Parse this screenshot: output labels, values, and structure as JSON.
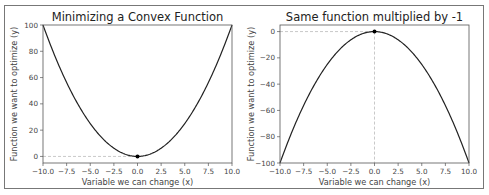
{
  "chart_data": [
    {
      "type": "line",
      "title": "Minimizing a Convex Function",
      "xlabel": "Variable we can change (x)",
      "ylabel": "Function we want to optimize (y)",
      "xlim": [
        -10,
        10
      ],
      "ylim": [
        -5,
        100
      ],
      "xticks": [
        "−10.0",
        "−7.5",
        "−5.0",
        "−2.5",
        "0.0",
        "2.5",
        "5.0",
        "7.5",
        "10.0"
      ],
      "yticks": [
        "0",
        "20",
        "40",
        "60",
        "80",
        "100"
      ],
      "function": "y = x^2",
      "x": [
        -10,
        -7.5,
        -5,
        -2.5,
        0,
        2.5,
        5,
        7.5,
        10
      ],
      "y": [
        100,
        56.25,
        25,
        6.25,
        0,
        6.25,
        25,
        56.25,
        100
      ],
      "annotations": [
        {
          "type": "point",
          "x": 0,
          "y": 0,
          "label": "minimum"
        },
        {
          "type": "dashed-hline",
          "y": 0
        }
      ],
      "grid": false
    },
    {
      "type": "line",
      "title": "Same function multiplied by -1",
      "xlabel": "Variable we can change (x)",
      "ylabel": "Function we want to optimize (y)",
      "xlim": [
        -10,
        10
      ],
      "ylim": [
        -100,
        5
      ],
      "xticks": [
        "−10.0",
        "−7.5",
        "−5.0",
        "−2.5",
        "0.0",
        "2.5",
        "5.0",
        "7.5",
        "10.0"
      ],
      "yticks": [
        "0",
        "−20",
        "−40",
        "−60",
        "−80",
        "−100"
      ],
      "function": "y = -x^2",
      "x": [
        -10,
        -7.5,
        -5,
        -2.5,
        0,
        2.5,
        5,
        7.5,
        10
      ],
      "y": [
        -100,
        -56.25,
        -25,
        -6.25,
        0,
        -6.25,
        -25,
        -56.25,
        -100
      ],
      "annotations": [
        {
          "type": "point",
          "x": 0,
          "y": 0,
          "label": "maximum"
        },
        {
          "type": "dashed-hline",
          "y": 0
        },
        {
          "type": "dashed-vline",
          "x": 0
        }
      ],
      "grid": false
    }
  ]
}
